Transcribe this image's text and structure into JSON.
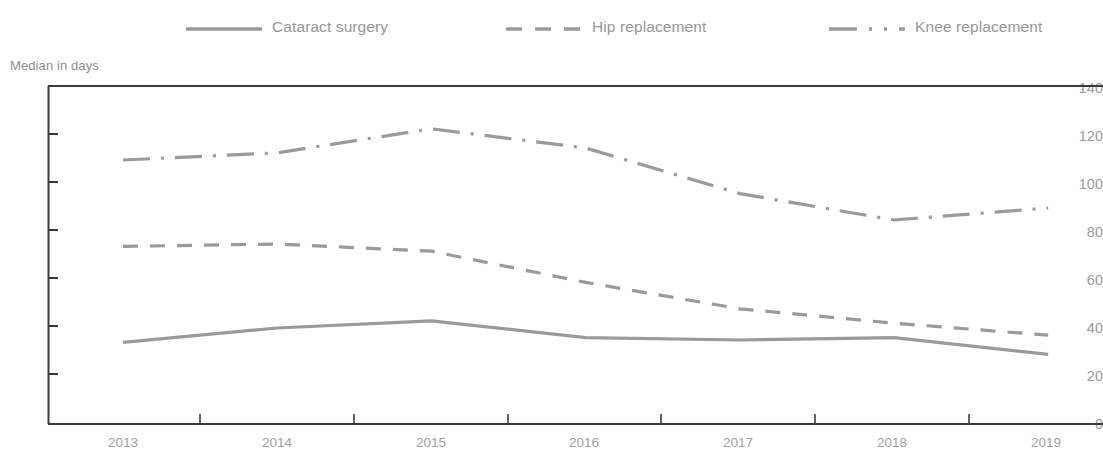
{
  "chart_data": {
    "type": "line",
    "title": "",
    "subtitle": "",
    "xlabel": "",
    "ylabel": "Median in days",
    "categories": [
      "2013",
      "2014",
      "2015",
      "2016",
      "2017",
      "2018",
      "2019"
    ],
    "ylim": [
      0,
      140
    ],
    "ytick_values": [
      0,
      20,
      40,
      60,
      80,
      100,
      120,
      140
    ],
    "ytick_labels": [
      "0",
      "20",
      "40",
      "60",
      "80",
      "100",
      "120",
      "140"
    ],
    "grid": false,
    "legend_position": "top",
    "series": [
      {
        "name": "Cataract surgery",
        "values": [
          34,
          40,
          43,
          36,
          35,
          36,
          29
        ],
        "style": "solid",
        "color": "#9a9a9a"
      },
      {
        "name": "Hip replacement",
        "values": [
          74,
          75,
          72,
          59,
          48,
          42,
          37
        ],
        "style": "dashed",
        "color": "#9a9a9a"
      },
      {
        "name": "Knee replacement",
        "values": [
          110,
          113,
          123,
          115,
          96,
          85,
          90
        ],
        "style": "dash-dot",
        "color": "#9a9a9a"
      }
    ]
  },
  "legend": {
    "items": [
      {
        "label": "Cataract surgery",
        "swatch": "solid-line-icon"
      },
      {
        "label": "Hip replacement",
        "swatch": "dashed-line-icon"
      },
      {
        "label": "Knee replacement",
        "swatch": "dash-dot-line-icon"
      }
    ]
  },
  "axes": {
    "y_title": "Median in days",
    "y_ticks": [
      "140",
      "120",
      "100",
      "80",
      "60",
      "40",
      "20",
      "0"
    ],
    "x_ticks": [
      "2013",
      "2014",
      "2015",
      "2016",
      "2017",
      "2018",
      "2019"
    ]
  },
  "colors": {
    "line": "#9a9a9a",
    "axis": "#3a3a3a",
    "text": "#9a9a9a"
  }
}
